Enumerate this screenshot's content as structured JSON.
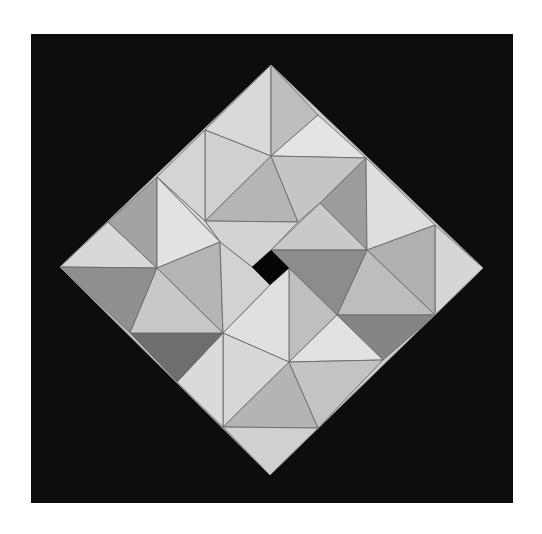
{
  "figure": {
    "width": 542,
    "height": 534,
    "background_color": "#ffffff",
    "frame": {
      "x": 31,
      "y": 34,
      "width": 482,
      "height": 469,
      "fill": "#0d0d0d"
    },
    "stroke_color": "#6a6a6a",
    "outer_diamond": [
      [
        271,
        65
      ],
      [
        483,
        268
      ],
      [
        270,
        475
      ],
      [
        60,
        267
      ]
    ],
    "center_hole": {
      "points": [
        [
          271,
          250
        ],
        [
          289,
          268
        ],
        [
          270,
          285
        ],
        [
          252,
          267
        ]
      ],
      "fill": "#050505"
    },
    "pieces": [
      {
        "name": "top-left-facet",
        "points": [
          [
            271,
            65
          ],
          [
            205,
            130
          ],
          [
            271,
            156
          ]
        ],
        "fill": "#d9d9d9"
      },
      {
        "name": "top-right-facet",
        "points": [
          [
            271,
            65
          ],
          [
            271,
            156
          ],
          [
            318,
            115
          ]
        ],
        "fill": "#bebebe"
      },
      {
        "name": "top-right-edge-facet",
        "points": [
          [
            318,
            115
          ],
          [
            271,
            156
          ],
          [
            366,
            158
          ]
        ],
        "fill": "#e4e4e4"
      },
      {
        "name": "top-inner-left",
        "points": [
          [
            205,
            130
          ],
          [
            271,
            156
          ],
          [
            205,
            221
          ]
        ],
        "fill": "#d0d0d0"
      },
      {
        "name": "top-edge-left",
        "points": [
          [
            157,
            177
          ],
          [
            205,
            130
          ],
          [
            205,
            221
          ]
        ],
        "fill": "#d4d4d4"
      },
      {
        "name": "top-center",
        "points": [
          [
            205,
            221
          ],
          [
            271,
            156
          ],
          [
            298,
            222
          ]
        ],
        "fill": "#b5b5b5"
      },
      {
        "name": "top-inner-right",
        "points": [
          [
            271,
            156
          ],
          [
            366,
            158
          ],
          [
            320,
            203
          ],
          [
            298,
            222
          ]
        ],
        "fill": "#c5c5c5"
      },
      {
        "name": "top-strip",
        "points": [
          [
            205,
            221
          ],
          [
            298,
            222
          ],
          [
            271,
            250
          ],
          [
            252,
            267
          ],
          [
            220,
            242
          ]
        ],
        "fill": "#d3d3d3"
      },
      {
        "name": "upper-right-dark",
        "points": [
          [
            366,
            158
          ],
          [
            367,
            250
          ],
          [
            320,
            203
          ]
        ],
        "fill": "#9c9c9c"
      },
      {
        "name": "upper-right-light",
        "points": [
          [
            366,
            158
          ],
          [
            435,
            225
          ],
          [
            367,
            250
          ]
        ],
        "fill": "#dedede"
      },
      {
        "name": "upper-right-inner",
        "points": [
          [
            320,
            203
          ],
          [
            367,
            250
          ],
          [
            271,
            250
          ]
        ],
        "fill": "#c9c9c9"
      },
      {
        "name": "right-tip",
        "points": [
          [
            435,
            225
          ],
          [
            483,
            268
          ],
          [
            435,
            315
          ]
        ],
        "fill": "#d6d6d6"
      },
      {
        "name": "right-upper-facet",
        "points": [
          [
            435,
            225
          ],
          [
            435,
            315
          ],
          [
            367,
            250
          ]
        ],
        "fill": "#b0b0b0"
      },
      {
        "name": "right-lower-facet",
        "points": [
          [
            367,
            250
          ],
          [
            435,
            315
          ],
          [
            337,
            315
          ]
        ],
        "fill": "#bdbdbd"
      },
      {
        "name": "right-dark-band",
        "points": [
          [
            271,
            250
          ],
          [
            367,
            250
          ],
          [
            337,
            315
          ],
          [
            289,
            268
          ]
        ],
        "fill": "#8c8c8c"
      },
      {
        "name": "lower-right-dark",
        "points": [
          [
            337,
            315
          ],
          [
            435,
            315
          ],
          [
            383,
            360
          ]
        ],
        "fill": "#858585"
      },
      {
        "name": "lower-right-medium",
        "points": [
          [
            289,
            268
          ],
          [
            337,
            315
          ],
          [
            289,
            362
          ]
        ],
        "fill": "#bfbfbf"
      },
      {
        "name": "lower-right-light",
        "points": [
          [
            337,
            315
          ],
          [
            383,
            360
          ],
          [
            289,
            362
          ]
        ],
        "fill": "#e2e2e2"
      },
      {
        "name": "center-light",
        "points": [
          [
            289,
            268
          ],
          [
            289,
            362
          ],
          [
            223,
            333
          ],
          [
            270,
            285
          ]
        ],
        "fill": "#e0e0e0"
      },
      {
        "name": "bottom-inner-left",
        "points": [
          [
            223,
            333
          ],
          [
            289,
            362
          ],
          [
            223,
            427
          ]
        ],
        "fill": "#d8d8d8"
      },
      {
        "name": "bottom-center",
        "points": [
          [
            289,
            362
          ],
          [
            318,
            428
          ],
          [
            223,
            427
          ]
        ],
        "fill": "#b4b4b4"
      },
      {
        "name": "bottom-inner-right",
        "points": [
          [
            289,
            362
          ],
          [
            383,
            360
          ],
          [
            318,
            428
          ]
        ],
        "fill": "#c3c3c3"
      },
      {
        "name": "bottom-tip",
        "points": [
          [
            223,
            427
          ],
          [
            318,
            428
          ],
          [
            270,
            475
          ]
        ],
        "fill": "#d0d0d0"
      },
      {
        "name": "bottom-edge-left",
        "points": [
          [
            177,
            382
          ],
          [
            223,
            333
          ],
          [
            223,
            427
          ]
        ],
        "fill": "#dadada"
      },
      {
        "name": "lower-left-dark",
        "points": [
          [
            130,
            333
          ],
          [
            223,
            333
          ],
          [
            177,
            382
          ]
        ],
        "fill": "#6e6e6e"
      },
      {
        "name": "left-tip-upper",
        "points": [
          [
            60,
            267
          ],
          [
            108,
            222
          ],
          [
            157,
            268
          ]
        ],
        "fill": "#d8d8d8"
      },
      {
        "name": "left-tip-lower",
        "points": [
          [
            60,
            267
          ],
          [
            157,
            268
          ],
          [
            130,
            333
          ]
        ],
        "fill": "#8f8f8f"
      },
      {
        "name": "left-lower-facet",
        "points": [
          [
            157,
            268
          ],
          [
            223,
            333
          ],
          [
            130,
            333
          ]
        ],
        "fill": "#c8c8c8"
      },
      {
        "name": "left-upper-dark",
        "points": [
          [
            108,
            222
          ],
          [
            157,
            177
          ],
          [
            157,
            268
          ]
        ],
        "fill": "#a3a3a3"
      },
      {
        "name": "left-upper-light",
        "points": [
          [
            157,
            177
          ],
          [
            220,
            242
          ],
          [
            157,
            268
          ]
        ],
        "fill": "#e2e2e2"
      },
      {
        "name": "left-center",
        "points": [
          [
            157,
            268
          ],
          [
            220,
            242
          ],
          [
            223,
            333
          ]
        ],
        "fill": "#b5b5b5"
      },
      {
        "name": "left-inner-strip",
        "points": [
          [
            220,
            242
          ],
          [
            252,
            267
          ],
          [
            270,
            285
          ],
          [
            223,
            333
          ]
        ],
        "fill": "#d2d2d2"
      },
      {
        "name": "upper-left-edge",
        "points": [
          [
            157,
            177
          ],
          [
            205,
            221
          ],
          [
            220,
            242
          ]
        ],
        "fill": "#d6d6d6"
      }
    ]
  }
}
